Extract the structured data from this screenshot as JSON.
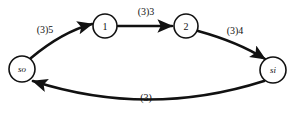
{
  "diagram": {
    "type": "directed-graph",
    "title": "",
    "background_color": "#ffffff",
    "stroke_color": "#111111",
    "nodes": [
      {
        "id": "so",
        "label": "so",
        "style": "italic",
        "cx": 22,
        "cy": 69,
        "r": 13
      },
      {
        "id": "n1",
        "label": "1",
        "style": "normal",
        "cx": 105,
        "cy": 26,
        "r": 12
      },
      {
        "id": "n2",
        "label": "2",
        "style": "normal",
        "cx": 186,
        "cy": 26,
        "r": 12
      },
      {
        "id": "si",
        "label": "si",
        "style": "italic",
        "cx": 273,
        "cy": 70,
        "r": 13
      }
    ],
    "edges": [
      {
        "id": "e-so-1",
        "from": "so",
        "to": "n1",
        "label": "(3)5",
        "label_x": 45,
        "label_y": 29,
        "shape": "curve-up",
        "path": "M 31 58 Q 62 32 92 24"
      },
      {
        "id": "e-1-2",
        "from": "n1",
        "to": "n2",
        "label": "(3)3",
        "label_x": 146,
        "label_y": 11,
        "shape": "straight",
        "path": "M 118 26 L 172 26"
      },
      {
        "id": "e-2-si",
        "from": "n2",
        "to": "si",
        "label": "(3)4",
        "label_x": 235,
        "label_y": 30,
        "shape": "curve-down",
        "path": "M 198 31 Q 238 42 265 59"
      },
      {
        "id": "e-si-so",
        "from": "si",
        "to": "so",
        "label": "(3)",
        "label_x": 146,
        "label_y": 97,
        "shape": "curve-bottom",
        "path": "M 264 81 Q 148 118 33 81"
      }
    ]
  }
}
